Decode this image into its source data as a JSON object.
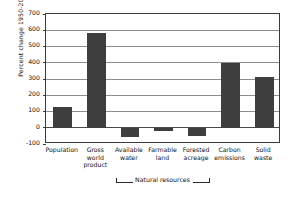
{
  "chart_data": {
    "type": "bar",
    "title": "",
    "subtitle": "",
    "xlabel": "",
    "ylabel": "Percent change 1950-2000",
    "ylim": [
      -100,
      700
    ],
    "ytick_step": 100,
    "grid": true,
    "legend": false,
    "bar_color": "#3e3e3e",
    "categories": [
      "Population",
      "Gross world product",
      "Available water",
      "Farmable land",
      "Forested acreage",
      "Carbon emissions",
      "Solid waste"
    ],
    "category_lines": [
      [
        "Population"
      ],
      [
        "Gross",
        "world",
        "product"
      ],
      [
        "Available",
        "water"
      ],
      [
        "Farmable",
        "land"
      ],
      [
        "Forested",
        "acreage"
      ],
      [
        "Carbon",
        "emissions"
      ],
      [
        "Solid",
        "waste"
      ]
    ],
    "values": [
      130,
      585,
      -55,
      -20,
      -50,
      400,
      310
    ],
    "ytick_labels": [
      "700",
      "600",
      "500",
      "400",
      "300",
      "200",
      "100",
      "0",
      "-100"
    ],
    "ytick_values": [
      700,
      600,
      500,
      400,
      300,
      200,
      100,
      0,
      -100
    ],
    "annotations": [
      {
        "name": "natural-resources-bracket",
        "label": "Natural resources",
        "spans_categories": [
          "Available water",
          "Farmable land",
          "Forested acreage"
        ],
        "start_index": 2,
        "end_index": 4
      }
    ]
  }
}
